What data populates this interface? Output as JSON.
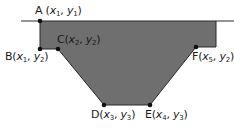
{
  "diagram": {
    "colors": {
      "fill": "#6f6f6f",
      "outline": "#2a2a2a",
      "point": "#111111",
      "text": "#1a1a1a",
      "background": "#ffffff"
    },
    "ground_line": {
      "left": {
        "x1": 21,
        "y1": 21,
        "x2": 40,
        "y2": 21
      },
      "right": {
        "x1": 216,
        "y1": 21,
        "x2": 234,
        "y2": 21
      }
    },
    "polygon": [
      [
        40,
        21
      ],
      [
        216,
        21
      ],
      [
        216,
        47
      ],
      [
        196,
        47
      ],
      [
        150,
        105
      ],
      [
        104,
        105
      ],
      [
        58,
        49
      ],
      [
        40,
        49
      ]
    ],
    "points": [
      {
        "id": "A",
        "letter": "A",
        "x_var": "x",
        "x_sub": "1",
        "y_var": "y",
        "y_sub": "1",
        "text": "A (x1, y1)",
        "cx": 40,
        "cy": 21,
        "label_left": 35,
        "label_top": 5
      },
      {
        "id": "B",
        "letter": "B",
        "x_var": "x",
        "x_sub": "1",
        "y_var": "y",
        "y_sub": "2",
        "text": "B(x1, y2)",
        "cx": 40,
        "cy": 49,
        "label_left": 5,
        "label_top": 51
      },
      {
        "id": "C",
        "letter": "C",
        "x_var": "x",
        "x_sub": "2",
        "y_var": "y",
        "y_sub": "2",
        "text": "C(x2, y2)",
        "cx": 58,
        "cy": 49,
        "label_left": 57,
        "label_top": 34
      },
      {
        "id": "D",
        "letter": "D",
        "x_var": "x",
        "x_sub": "3",
        "y_var": "y",
        "y_sub": "3",
        "text": "D(x3, y3)",
        "cx": 104,
        "cy": 105,
        "label_left": 91,
        "label_top": 109
      },
      {
        "id": "E",
        "letter": "E",
        "x_var": "x",
        "x_sub": "4",
        "y_var": "y",
        "y_sub": "3",
        "text": "E(x4, y3)",
        "cx": 150,
        "cy": 105,
        "label_left": 145,
        "label_top": 109
      },
      {
        "id": "F",
        "letter": "F",
        "x_var": "x",
        "x_sub": "5",
        "y_var": "y",
        "y_sub": "2",
        "text": "F(x5, y2)",
        "cx": 196,
        "cy": 47,
        "label_left": 192,
        "label_top": 51
      }
    ]
  }
}
